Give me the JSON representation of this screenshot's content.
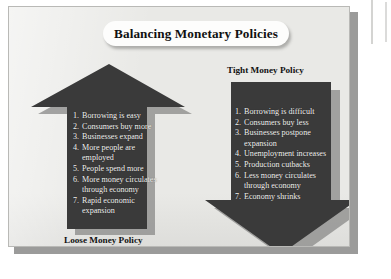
{
  "figure": {
    "title": "Balancing Monetary Policies",
    "colors": {
      "panel_background": "#e9e9e6",
      "panel_border": "#b9b9b6",
      "arrow_fill": "#3a3a3a",
      "arrow_shadow": "#8f8f8d",
      "title_pill_background": "#fdfdfc",
      "list_text": "#f2f2f0",
      "label_text": "#121212"
    }
  },
  "left_arrow": {
    "direction": "up",
    "label": "Loose Money Policy",
    "label_position": "bottom",
    "items": [
      "Borrowing is easy",
      "Consumers buy more",
      "Businesses expand",
      "More people are employed",
      "People spend more",
      "More money circulates through economy",
      "Rapid economic expansion"
    ]
  },
  "right_arrow": {
    "direction": "down",
    "label": "Tight Money Policy",
    "label_position": "top",
    "items": [
      "Borrowing is difficult",
      "Consumers buy less",
      "Businesses postpone expansion",
      "Unemployment increases",
      "Production cutbacks",
      "Less money circulates through economy",
      "Economy shrinks"
    ]
  }
}
